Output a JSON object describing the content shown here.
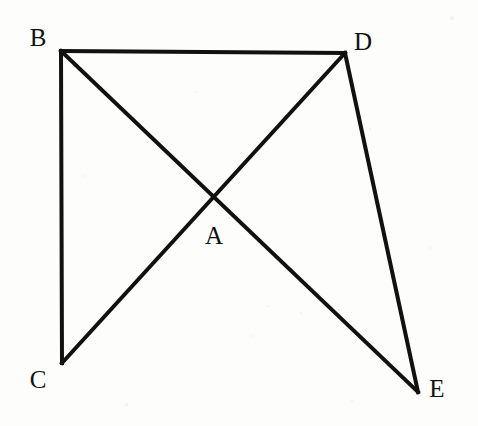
{
  "figure": {
    "type": "line-diagram",
    "canvas": {
      "width": 478,
      "height": 426
    },
    "style": {
      "background_color": "#fdfdfc",
      "stroke_color": "#111111",
      "stroke_width": 4,
      "label_color": "#111111",
      "label_font_size": 25
    },
    "points": [
      {
        "id": "B",
        "label": "B",
        "x": 61,
        "y": 51,
        "label_x": 38,
        "label_y": 37
      },
      {
        "id": "D",
        "label": "D",
        "x": 345,
        "y": 53,
        "label_x": 363,
        "label_y": 41
      },
      {
        "id": "A",
        "label": "A",
        "x": 213,
        "y": 198,
        "label_x": 214,
        "label_y": 235
      },
      {
        "id": "C",
        "label": "C",
        "x": 62,
        "y": 363,
        "label_x": 38,
        "label_y": 379
      },
      {
        "id": "E",
        "label": "E",
        "x": 418,
        "y": 392,
        "label_x": 437,
        "label_y": 388
      }
    ],
    "segments": [
      {
        "id": "BD",
        "from": "B",
        "to": "D",
        "x1": 61,
        "y1": 51,
        "x2": 345,
        "y2": 53
      },
      {
        "id": "BC",
        "from": "B",
        "to": "C",
        "x1": 61,
        "y1": 51,
        "x2": 62,
        "y2": 363
      },
      {
        "id": "BE",
        "from": "B",
        "to": "E",
        "x1": 61,
        "y1": 51,
        "x2": 418,
        "y2": 392
      },
      {
        "id": "CD",
        "from": "C",
        "to": "D",
        "x1": 62,
        "y1": 363,
        "x2": 345,
        "y2": 53
      },
      {
        "id": "DE",
        "from": "D",
        "to": "E",
        "x1": 345,
        "y1": 53,
        "x2": 418,
        "y2": 392
      }
    ],
    "speckles": [
      {
        "x": 452,
        "y": 18,
        "r": 1.6
      },
      {
        "x": 268,
        "y": 306,
        "r": 1.4
      },
      {
        "x": 301,
        "y": 313,
        "r": 1.2
      },
      {
        "x": 253,
        "y": 336,
        "r": 1.3
      },
      {
        "x": 126,
        "y": 404,
        "r": 1.5
      },
      {
        "x": 370,
        "y": 129,
        "r": 1.2
      },
      {
        "x": 196,
        "y": 92,
        "r": 1.1
      },
      {
        "x": 430,
        "y": 248,
        "r": 1.3
      },
      {
        "x": 85,
        "y": 176,
        "r": 1.2
      },
      {
        "x": 352,
        "y": 401,
        "r": 1.4
      }
    ]
  }
}
